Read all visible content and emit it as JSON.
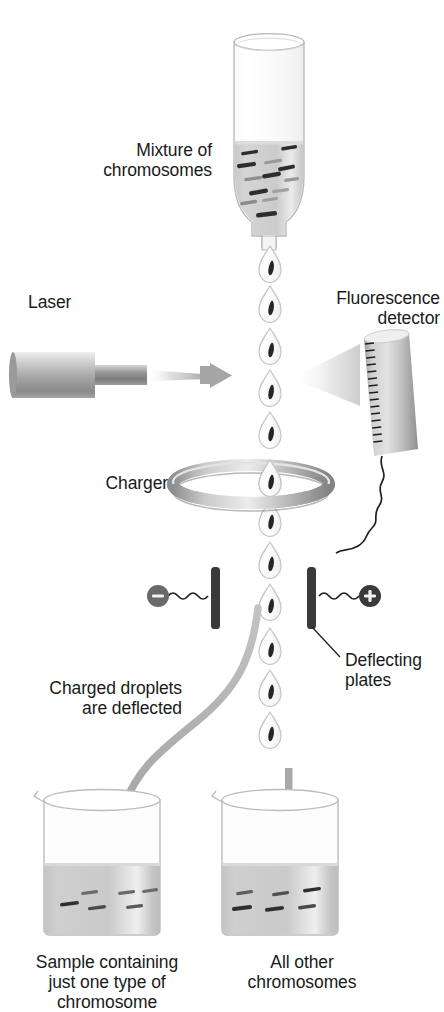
{
  "diagram": {
    "background_color": "#ffffff",
    "text_color": "#1a1a1a"
  },
  "labels": {
    "mixture": "Mixture of\nchromosomes",
    "laser": "Laser",
    "fluorescence_detector": "Fluorescence\ndetector",
    "charger": "Charger",
    "deflecting_plates": "Deflecting\nplates",
    "charged_droplets": "Charged droplets\nare deflected",
    "beaker_left": "Sample containing\njust one type of\nchromosome",
    "beaker_right": "All other\nchromosomes",
    "minus_sign": "−",
    "plus_sign": "+"
  },
  "colors": {
    "metal_light": "#e8e8e8",
    "metal_mid": "#b4b4b4",
    "metal_dark": "#8f8f8f",
    "plate_dark": "#3f3f3f",
    "liquid": "#c9c9c9",
    "glass_outline": "#b9b9b9",
    "chromosome": "#2b2b2b",
    "arrow_gray": "#a8a8a8",
    "wire": "#1f1f1f"
  },
  "droplets": {
    "count": 12,
    "x_center": 270,
    "y_positions": [
      243,
      283,
      323,
      363,
      403,
      443,
      483,
      523,
      563,
      603,
      643,
      683,
      723
    ],
    "shape": "teardrop"
  },
  "tube": {
    "x": 232,
    "y": 30,
    "width": 72,
    "height": 210,
    "liquid_level_y": 140,
    "chromosome_count": 13
  },
  "beakers": [
    {
      "name": "left",
      "x": 40,
      "y": 790,
      "width": 140,
      "height": 145,
      "liquid_level_y": 862,
      "chromosome_count": 6
    },
    {
      "name": "right",
      "x": 218,
      "y": 790,
      "width": 140,
      "height": 145,
      "liquid_level_y": 862,
      "chromosome_count": 6
    }
  ]
}
